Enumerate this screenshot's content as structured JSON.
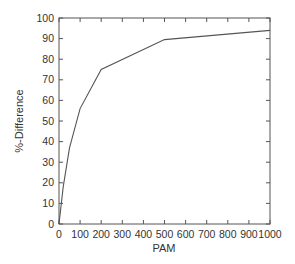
{
  "chart_data": {
    "type": "line",
    "title": "",
    "xlabel": "PAM",
    "ylabel": "%-Difference",
    "xlim": [
      0,
      1000
    ],
    "ylim": [
      0,
      100
    ],
    "xticks": [
      0,
      100,
      200,
      300,
      400,
      500,
      600,
      700,
      800,
      900,
      1000
    ],
    "yticks": [
      0,
      10,
      20,
      30,
      40,
      50,
      60,
      70,
      80,
      90,
      100
    ],
    "grid": false,
    "legend": null,
    "series": [
      {
        "name": "%-Difference",
        "x": [
          0,
          20,
          50,
          100,
          200,
          500,
          1000
        ],
        "values": [
          0,
          18,
          37,
          56,
          75,
          89.5,
          94
        ]
      }
    ],
    "colors": {
      "line": "#555555",
      "axes": "#555555",
      "text": "#333333"
    }
  }
}
